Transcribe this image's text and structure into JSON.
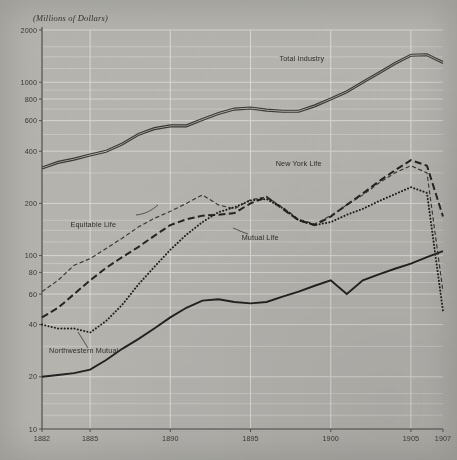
{
  "chart_data": {
    "type": "line",
    "title": "",
    "subtitle": "",
    "ylabel": "(Millions of Dollars)",
    "xlabel": "",
    "yscale": "log",
    "ylim": [
      10,
      2000
    ],
    "xlim": [
      1882,
      1907
    ],
    "grid": true,
    "legend_position": "inline-annotations",
    "yticks": [
      {
        "value": 2000,
        "label": "2000"
      },
      {
        "value": 1000,
        "label": "1000"
      },
      {
        "value": 800,
        "label": "800"
      },
      {
        "value": 600,
        "label": "600"
      },
      {
        "value": 400,
        "label": "400"
      },
      {
        "value": 200,
        "label": "200"
      },
      {
        "value": 100,
        "label": "100"
      },
      {
        "value": 80,
        "label": "80"
      },
      {
        "value": 60,
        "label": "60"
      },
      {
        "value": 40,
        "label": "40"
      },
      {
        "value": 20,
        "label": "20"
      },
      {
        "value": 10,
        "label": "10"
      }
    ],
    "y_minor_gridlines": [
      1600,
      1400,
      1200,
      900,
      700,
      500,
      300,
      160,
      140,
      120,
      90,
      70,
      50,
      30,
      16,
      14,
      12
    ],
    "xticks": [
      {
        "value": 1882,
        "label": "1882"
      },
      {
        "value": 1885,
        "label": "1885"
      },
      {
        "value": 1890,
        "label": "1890"
      },
      {
        "value": 1895,
        "label": "1895"
      },
      {
        "value": 1900,
        "label": "1900"
      },
      {
        "value": 1905,
        "label": "1905"
      },
      {
        "value": 1907,
        "label": "1907"
      }
    ],
    "x_gridlines": [
      1885,
      1890,
      1895,
      1900,
      1905
    ],
    "x": [
      1882,
      1883,
      1884,
      1885,
      1886,
      1887,
      1888,
      1889,
      1890,
      1891,
      1892,
      1893,
      1894,
      1895,
      1896,
      1897,
      1898,
      1899,
      1900,
      1901,
      1902,
      1903,
      1904,
      1905,
      1906,
      1907
    ],
    "series": [
      {
        "name": "Total Industry",
        "style": "double-solid",
        "label_x": 1898.2,
        "label_y": 1330,
        "values": [
          320,
          345,
          360,
          380,
          400,
          440,
          500,
          540,
          560,
          560,
          610,
          660,
          700,
          710,
          690,
          680,
          680,
          730,
          800,
          880,
          1000,
          1130,
          1280,
          1430,
          1440,
          1300
        ]
      },
      {
        "name": "New York Life",
        "style": "long-dash",
        "label_x": 1898.0,
        "label_y": 330,
        "values": [
          44,
          50,
          60,
          72,
          85,
          98,
          112,
          130,
          150,
          162,
          170,
          172,
          176,
          200,
          218,
          186,
          160,
          150,
          168,
          196,
          228,
          268,
          310,
          355,
          330,
          168
        ]
      },
      {
        "name": "Equitable Life",
        "style": "fine-dash",
        "label_x": 1885.2,
        "label_y": 146,
        "values": [
          62,
          72,
          88,
          96,
          110,
          126,
          146,
          164,
          180,
          200,
          224,
          196,
          186,
          210,
          218,
          190,
          162,
          152,
          170,
          196,
          224,
          262,
          300,
          330,
          300,
          62
        ]
      },
      {
        "name": "Mutual Life",
        "style": "dotted",
        "label_x": 1895.6,
        "label_y": 123,
        "values": [
          40,
          38,
          38,
          36,
          42,
          52,
          68,
          86,
          108,
          132,
          156,
          178,
          190,
          208,
          212,
          188,
          160,
          150,
          156,
          172,
          186,
          206,
          226,
          248,
          230,
          48
        ]
      },
      {
        "name": "Northwestern Mutual",
        "style": "solid",
        "label_x": 1884.6,
        "label_y": 27.5,
        "values": [
          20,
          20.5,
          21,
          22,
          25,
          29,
          33,
          38,
          44,
          50,
          55,
          56,
          54,
          53,
          54,
          58,
          62,
          67,
          72,
          60,
          72,
          78,
          84,
          90,
          98,
          106
        ]
      }
    ]
  },
  "annotations": {
    "unit_caption": "(Millions of Dollars)"
  }
}
